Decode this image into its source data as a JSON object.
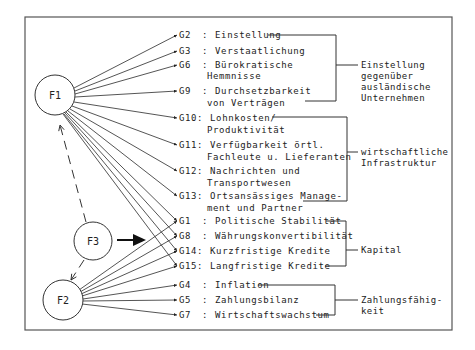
{
  "factors": [
    {
      "id": "F1",
      "label": "F1"
    },
    {
      "id": "F2",
      "label": "F2"
    },
    {
      "id": "F3",
      "label": "F3"
    }
  ],
  "variables": [
    {
      "code": "G2 ",
      "sep": ":",
      "line1": "Einstellung",
      "line2": ""
    },
    {
      "code": "G3 ",
      "sep": ":",
      "line1": "Verstaatlichung",
      "line2": ""
    },
    {
      "code": "G6 ",
      "sep": ":",
      "line1": "Bürokratische",
      "line2": "Hemmnisse"
    },
    {
      "code": "G9 ",
      "sep": ":",
      "line1": "Durchsetzbarkeit",
      "line2": "von Verträgen"
    },
    {
      "code": "G10",
      "sep": ":",
      "line1": "Lohnkosten/",
      "line2": "Produktivität"
    },
    {
      "code": "G11",
      "sep": ":",
      "line1": "Verfügbarkeit örtl.",
      "line2": "Fachleute u. Lieferanten"
    },
    {
      "code": "G12",
      "sep": ":",
      "line1": "Nachrichten und",
      "line2": "Transportwesen"
    },
    {
      "code": "G13",
      "sep": ":",
      "line1": "Ortsansässiges Manage-",
      "line2": "ment und Partner"
    },
    {
      "code": "G1 ",
      "sep": ":",
      "line1": "Politische Stabilität",
      "line2": ""
    },
    {
      "code": "G8 ",
      "sep": ":",
      "line1": "Währungskonvertibilität",
      "line2": ""
    },
    {
      "code": "G14",
      "sep": ":",
      "line1": "Kurzfristige Kredite",
      "line2": ""
    },
    {
      "code": "G15",
      "sep": ":",
      "line1": "Langfristige Kredite",
      "line2": ""
    },
    {
      "code": "G4 ",
      "sep": ":",
      "line1": "Inflation",
      "line2": ""
    },
    {
      "code": "G5 ",
      "sep": ":",
      "line1": "Zahlungsbilanz",
      "line2": ""
    },
    {
      "code": "G7 ",
      "sep": ":",
      "line1": "Wirtschaftswachstum",
      "line2": ""
    }
  ],
  "groups": [
    {
      "name": "einstellung",
      "lines": [
        "Einstellung",
        "gegenüber",
        "ausländische",
        "Unternehmen"
      ]
    },
    {
      "name": "infrastruktur",
      "lines": [
        "wirtschaftliche",
        "Infrastruktur"
      ]
    },
    {
      "name": "kapital",
      "lines": [
        "Kapital"
      ]
    },
    {
      "name": "zahlungsfaehigkeit",
      "lines": [
        "Zahlungsfähig-",
        "keit"
      ]
    }
  ]
}
